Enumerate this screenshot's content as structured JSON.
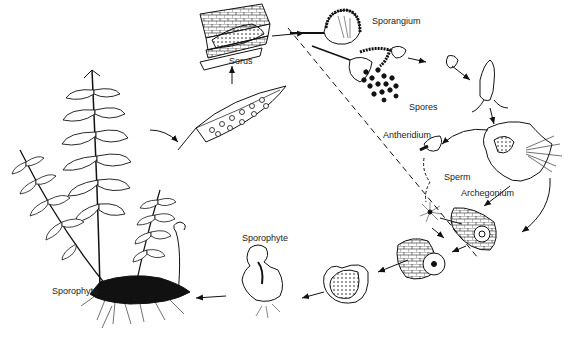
{
  "diagram": {
    "background": "#ffffff",
    "ink": "#111111",
    "labels": {
      "sorus": "Sorus",
      "sporangium": "Sporangium",
      "spores": "Spores",
      "antheridium": "Antheridium",
      "sperm": "Sperm",
      "archegonium": "Archegonium",
      "sporophyte_young": "Sporophyte",
      "sporophyte_mature": "Sporophyte"
    },
    "stages": [
      "mature sporophyte (fern plant)",
      "fertile pinna with sori",
      "sorus cross-section",
      "sporangium",
      "sporangium releasing spores",
      "germinating spore",
      "gametophyte (prothallus)",
      "antheridium releasing sperm",
      "archegonium with egg",
      "zygote in archegonium",
      "embryo",
      "young sporophyte"
    ],
    "divider": "dashed line separating sporophyte (2n) and gametophyte (n) phases"
  }
}
